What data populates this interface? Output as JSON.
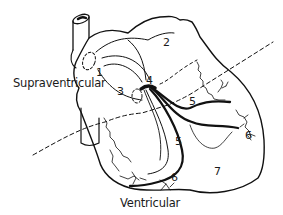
{
  "diagram": {
    "type": "heart-conduction-system",
    "region_labels": {
      "supraventricular": "Supraventricular",
      "ventricular": "Ventricular"
    },
    "numbered_labels": [
      {
        "id": "1",
        "text": "1"
      },
      {
        "id": "2",
        "text": "2"
      },
      {
        "id": "3",
        "text": "3"
      },
      {
        "id": "4",
        "text": "4"
      },
      {
        "id": "5a",
        "text": "5"
      },
      {
        "id": "5b",
        "text": "5"
      },
      {
        "id": "6a",
        "text": "6"
      },
      {
        "id": "6b",
        "text": "6"
      },
      {
        "id": "7",
        "text": "7"
      }
    ],
    "colors": {
      "line": "#111111",
      "background": "#ffffff"
    }
  }
}
